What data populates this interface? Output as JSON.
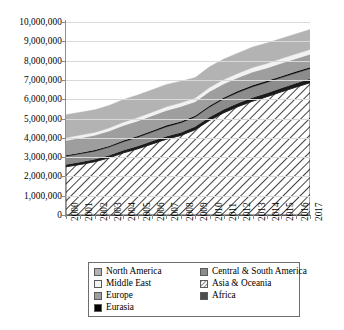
{
  "chart_data": {
    "type": "area",
    "title": "",
    "subtitle": "",
    "xlabel": "",
    "ylabel": "",
    "stacked": true,
    "grid": true,
    "legend_position": "bottom",
    "xlim": [
      2000,
      2017
    ],
    "ylim": [
      0,
      10000000
    ],
    "y_tick_step": 1000000,
    "categories": [
      2000,
      2001,
      2002,
      2003,
      2004,
      2005,
      2006,
      2007,
      2008,
      2009,
      2010,
      2011,
      2012,
      2013,
      2014,
      2015,
      2016,
      2017
    ],
    "x_tick_labels": [
      "2000",
      "2001",
      "2002",
      "2003",
      "2004",
      "2005",
      "2006",
      "2007",
      "2008",
      "2009",
      "2010",
      "2011",
      "2012",
      "2013",
      "2014",
      "2015",
      "2016",
      "2017"
    ],
    "y_tick_labels": [
      "0",
      "1,000,000",
      "2,000,000",
      "3,000,000",
      "4,000,000",
      "5,000,000",
      "6,000,000",
      "7,000,000",
      "8,000,000",
      "9,000,000",
      "10,000,000"
    ],
    "series": [
      {
        "name": "Asia & Oceania",
        "fill": "hatch",
        "color": "#ffffff",
        "values": [
          2500000,
          2620000,
          2760000,
          2960000,
          3220000,
          3430000,
          3680000,
          3930000,
          4120000,
          4420000,
          4900000,
          5300000,
          5620000,
          5900000,
          6130000,
          6380000,
          6620000,
          6850000
        ]
      },
      {
        "name": "Africa",
        "fill": "solid",
        "color": "#1a1a1a",
        "values": [
          120000,
          125000,
          128000,
          132000,
          140000,
          145000,
          150000,
          155000,
          160000,
          165000,
          172000,
          178000,
          182000,
          188000,
          192000,
          196000,
          200000,
          205000
        ]
      },
      {
        "name": "Central & South America",
        "fill": "solid",
        "color": "#8c8c8c",
        "values": [
          420000,
          425000,
          420000,
          425000,
          440000,
          455000,
          470000,
          490000,
          500000,
          495000,
          520000,
          540000,
          555000,
          560000,
          555000,
          545000,
          535000,
          530000
        ]
      },
      {
        "name": "Eurasia",
        "fill": "solid",
        "color": "#000000",
        "values": [
          60000,
          60000,
          62000,
          63000,
          65000,
          66000,
          68000,
          70000,
          71000,
          68000,
          72000,
          74000,
          75000,
          76000,
          75000,
          74000,
          74000,
          75000
        ]
      },
      {
        "name": "Europe",
        "fill": "solid",
        "color": "#9e9e9e",
        "values": [
          760000,
          765000,
          760000,
          770000,
          775000,
          780000,
          780000,
          775000,
          765000,
          720000,
          730000,
          710000,
          690000,
          685000,
          665000,
          670000,
          670000,
          665000
        ]
      },
      {
        "name": "Middle East",
        "fill": "solid",
        "color": "#f2f2f2",
        "values": [
          140000,
          145000,
          150000,
          158000,
          165000,
          172000,
          180000,
          188000,
          196000,
          200000,
          210000,
          218000,
          226000,
          232000,
          236000,
          240000,
          244000,
          248000
        ]
      },
      {
        "name": "North America",
        "fill": "solid",
        "color": "#b3b3b3",
        "values": [
          1200000,
          1185000,
          1175000,
          1170000,
          1180000,
          1175000,
          1165000,
          1160000,
          1120000,
          1050000,
          1080000,
          1065000,
          1050000,
          1060000,
          1055000,
          1045000,
          1040000,
          1040000
        ]
      }
    ],
    "totals": [
      5200000,
      5325000,
      5455000,
      5678000,
      5985000,
      6223000,
      6493000,
      6768000,
      6932000,
      7118000,
      7684000,
      8085000,
      8398000,
      8701000,
      8863000,
      9190000,
      9383000,
      9613000
    ]
  },
  "legend": {
    "items": [
      {
        "label": "North America",
        "swatch": "light-gray-swatch",
        "color": "#b3b3b3"
      },
      {
        "label": "Central & South America",
        "swatch": "dark-gray-swatch",
        "color": "#8c8c8c"
      },
      {
        "label": "Middle East",
        "swatch": "white-swatch",
        "color": "#f2f2f2"
      },
      {
        "label": "Asia & Oceania",
        "swatch": "hatched-swatch",
        "color": "#ffffff"
      },
      {
        "label": "Europe",
        "swatch": "medium-gray-swatch",
        "color": "#9e9e9e"
      },
      {
        "label": "Africa",
        "swatch": "dark-swatch",
        "color": "#4d4d4d"
      },
      {
        "label": "Eurasia",
        "swatch": "black-swatch",
        "color": "#000000"
      }
    ]
  }
}
